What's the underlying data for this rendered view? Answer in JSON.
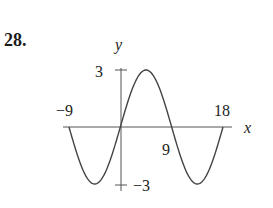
{
  "problem_number": "28.",
  "chart_data": {
    "type": "line",
    "title": "",
    "xlabel": "x",
    "ylabel": "y",
    "function": "y = 3 sin(πx/9)",
    "xlim": [
      -9,
      18
    ],
    "ylim": [
      -3,
      3
    ],
    "x_ticks": [
      "-9",
      "9",
      "18"
    ],
    "y_ticks": [
      "3",
      "-3"
    ],
    "grid": false,
    "series": [
      {
        "name": "curve",
        "x": [
          -9,
          -4.5,
          0,
          4.5,
          9,
          13.5,
          18
        ],
        "values": [
          0,
          -3,
          0,
          3,
          0,
          -3,
          0
        ]
      }
    ]
  },
  "labels": {
    "y_axis": "y",
    "x_axis": "x",
    "y_max": "3",
    "y_min": "−3",
    "x_min": "−9",
    "x_mid": "9",
    "x_max": "18"
  }
}
